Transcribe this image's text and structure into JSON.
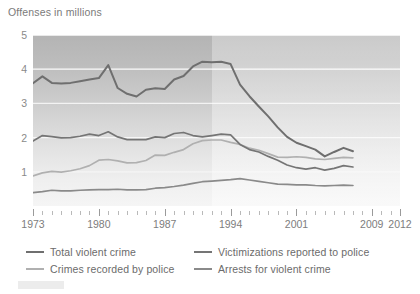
{
  "chart_data": {
    "type": "line",
    "title": "Offenses in millions",
    "xlabel": "",
    "ylabel": "Offenses in millions",
    "xlim": [
      1973,
      2012
    ],
    "ylim": [
      0,
      5
    ],
    "ytick_labels": [
      "5",
      "4",
      "3",
      "2",
      "1"
    ],
    "ytick_values": [
      5,
      4,
      3,
      2,
      1
    ],
    "xtick_labels": [
      "1973",
      "1980",
      "1987",
      "1994",
      "2001",
      "2009",
      "2012"
    ],
    "xtick_values": [
      1973,
      1980,
      1987,
      1994,
      2001,
      2009,
      2012
    ],
    "grid": "horizontal-white",
    "legend_position": "below-axis",
    "shaded_region_note": "background lightens after 1994",
    "x": [
      1973,
      1974,
      1975,
      1976,
      1977,
      1978,
      1979,
      1980,
      1981,
      1982,
      1983,
      1984,
      1985,
      1986,
      1987,
      1988,
      1989,
      1990,
      1991,
      1992,
      1993,
      1994,
      1995,
      1996,
      1997,
      1998,
      1999,
      2000,
      2001,
      2002,
      2003,
      2004,
      2005,
      2006,
      2007
    ],
    "series": [
      {
        "name": "Total violent crime",
        "color": "#6f6f6f",
        "values": [
          3.59,
          3.79,
          3.6,
          3.58,
          3.6,
          3.65,
          3.7,
          3.74,
          4.12,
          3.45,
          3.28,
          3.2,
          3.4,
          3.44,
          3.42,
          3.7,
          3.8,
          4.08,
          4.22,
          4.2,
          4.22,
          4.15,
          3.55,
          3.21,
          2.91,
          2.62,
          2.3,
          2.02,
          1.85,
          1.75,
          1.65,
          1.45,
          1.58,
          1.7,
          1.6
        ]
      },
      {
        "name": "Victimizations reported to police",
        "color": "#757575",
        "values": [
          1.9,
          2.06,
          2.03,
          1.99,
          2.0,
          2.04,
          2.1,
          2.06,
          2.17,
          2.02,
          1.94,
          1.94,
          1.94,
          2.02,
          2.0,
          2.12,
          2.15,
          2.06,
          2.02,
          2.06,
          2.1,
          2.08,
          1.8,
          1.65,
          1.58,
          1.45,
          1.34,
          1.2,
          1.12,
          1.08,
          1.12,
          1.05,
          1.1,
          1.18,
          1.14
        ]
      },
      {
        "name": "Crimes recorded by police",
        "color": "#b0b0b0",
        "values": [
          0.88,
          0.97,
          1.01,
          0.99,
          1.03,
          1.09,
          1.18,
          1.34,
          1.36,
          1.32,
          1.26,
          1.27,
          1.33,
          1.49,
          1.48,
          1.57,
          1.65,
          1.82,
          1.91,
          1.93,
          1.93,
          1.86,
          1.8,
          1.69,
          1.63,
          1.53,
          1.43,
          1.42,
          1.44,
          1.42,
          1.38,
          1.36,
          1.39,
          1.42,
          1.41
        ]
      },
      {
        "name": "Arrests for violent crime",
        "color": "#8a8a8a",
        "values": [
          0.39,
          0.42,
          0.46,
          0.44,
          0.44,
          0.46,
          0.47,
          0.48,
          0.48,
          0.49,
          0.47,
          0.47,
          0.48,
          0.52,
          0.54,
          0.57,
          0.61,
          0.66,
          0.71,
          0.73,
          0.75,
          0.77,
          0.8,
          0.76,
          0.72,
          0.68,
          0.64,
          0.63,
          0.62,
          0.62,
          0.6,
          0.59,
          0.6,
          0.61,
          0.6
        ]
      }
    ]
  },
  "legend": {
    "items": [
      {
        "label": "Total violent crime",
        "color": "#6f6f6f"
      },
      {
        "label": "Victimizations reported to police",
        "color": "#757575"
      },
      {
        "label": "Crimes recorded by police",
        "color": "#b0b0b0"
      },
      {
        "label": "Arrests for violent crime",
        "color": "#8a8a8a"
      }
    ]
  }
}
